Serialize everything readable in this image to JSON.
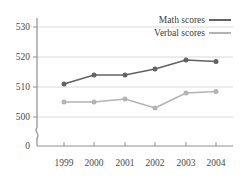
{
  "chart_data": {
    "type": "line",
    "title": "",
    "xlabel": "",
    "ylabel": "",
    "categories": [
      "1999",
      "2000",
      "2001",
      "2002",
      "2003",
      "2004"
    ],
    "series": [
      {
        "name": "Math scores",
        "color": "#636363",
        "values": [
          511,
          514,
          514,
          516,
          519,
          518.5
        ]
      },
      {
        "name": "Verbal scores",
        "color": "#b3b3b3",
        "values": [
          505,
          505,
          506,
          503,
          508,
          508.5
        ]
      }
    ],
    "ytick_labels": [
      "0",
      "500",
      "510",
      "520",
      "530"
    ],
    "ylim": [
      500,
      530
    ],
    "axis_break": true,
    "grid": "horizontal",
    "legend_position": "top-right",
    "legend": [
      "Math scores",
      "Verbal scores"
    ]
  },
  "axis": {
    "y_ticks": [
      {
        "label": "530"
      },
      {
        "label": "520"
      },
      {
        "label": "510"
      },
      {
        "label": "500"
      },
      {
        "label": "0"
      }
    ],
    "x_ticks": [
      {
        "label": "1999"
      },
      {
        "label": "2000"
      },
      {
        "label": "2001"
      },
      {
        "label": "2002"
      },
      {
        "label": "2003"
      },
      {
        "label": "2004"
      }
    ]
  },
  "legend": {
    "items": [
      {
        "label": "Math scores"
      },
      {
        "label": "Verbal scores"
      }
    ]
  },
  "colors": {
    "math": "#636363",
    "verbal": "#b3b3b3",
    "grid": "#d9d9d9",
    "axis": "#8f8f8f",
    "text": "#3b3b3b"
  }
}
